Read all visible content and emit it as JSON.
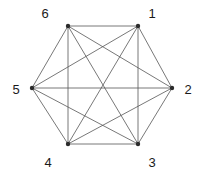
{
  "figure": {
    "kind": "graph-diagram",
    "name": "complete-graph-k6",
    "background_color": "#ffffff",
    "edge_color": "#555555",
    "edge_width": 0.8,
    "vertex_color": "#2b2b2b",
    "vertex_radius": 2.2,
    "label_color": "#1a1a1a",
    "width": 203,
    "height": 176
  },
  "vertices": [
    {
      "id": "1",
      "label": "1",
      "x": 138,
      "y": 26,
      "label_x": 152,
      "label_y": 13
    },
    {
      "id": "2",
      "label": "2",
      "x": 172,
      "y": 88,
      "label_x": 188,
      "label_y": 89
    },
    {
      "id": "3",
      "label": "3",
      "x": 138,
      "y": 144,
      "label_x": 152,
      "label_y": 162
    },
    {
      "id": "4",
      "label": "4",
      "x": 68,
      "y": 144,
      "label_x": 48,
      "label_y": 162
    },
    {
      "id": "5",
      "label": "5",
      "x": 32,
      "y": 88,
      "label_x": 16,
      "label_y": 89
    },
    {
      "id": "6",
      "label": "6",
      "x": 68,
      "y": 26,
      "label_x": 45,
      "label_y": 13
    }
  ],
  "edges": [
    {
      "from": "1",
      "to": "2",
      "kind": "side"
    },
    {
      "from": "2",
      "to": "3",
      "kind": "side"
    },
    {
      "from": "3",
      "to": "4",
      "kind": "side"
    },
    {
      "from": "4",
      "to": "5",
      "kind": "side"
    },
    {
      "from": "5",
      "to": "6",
      "kind": "side"
    },
    {
      "from": "6",
      "to": "1",
      "kind": "side"
    },
    {
      "from": "1",
      "to": "3",
      "kind": "short-diagonal"
    },
    {
      "from": "2",
      "to": "4",
      "kind": "short-diagonal"
    },
    {
      "from": "3",
      "to": "5",
      "kind": "short-diagonal"
    },
    {
      "from": "4",
      "to": "6",
      "kind": "short-diagonal"
    },
    {
      "from": "5",
      "to": "1",
      "kind": "short-diagonal"
    },
    {
      "from": "6",
      "to": "2",
      "kind": "short-diagonal"
    },
    {
      "from": "1",
      "to": "4",
      "kind": "long-diagonal"
    },
    {
      "from": "2",
      "to": "5",
      "kind": "long-diagonal"
    },
    {
      "from": "3",
      "to": "6",
      "kind": "long-diagonal"
    }
  ]
}
